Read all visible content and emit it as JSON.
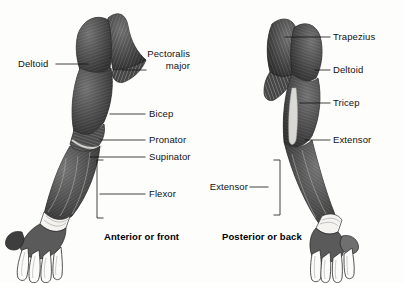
{
  "figure": {
    "title_anterior": "Anterior or front",
    "title_posterior": "Posterior or back",
    "background_color": "#fdfdfc",
    "ink_color": "#111111",
    "muscle_tone_dark": "#3a3a3a",
    "muscle_tone_mid": "#6b6b6b",
    "muscle_tone_light": "#a8a8a8",
    "tendon_color": "#f2f1ee"
  },
  "anterior": {
    "view_label": "Anterior or front",
    "labels": [
      {
        "id": "deltoid",
        "text": "Deltoid",
        "align": "left"
      },
      {
        "id": "pectoralis",
        "text": "Pectoralis",
        "align": "right"
      },
      {
        "id": "pectoralis_sub",
        "text": "major",
        "align": "right"
      },
      {
        "id": "bicep",
        "text": "Bicep",
        "align": "left"
      },
      {
        "id": "pronator",
        "text": "Pronator",
        "align": "left"
      },
      {
        "id": "supinator",
        "text": "Supinator",
        "align": "left"
      },
      {
        "id": "flexor",
        "text": "Flexor",
        "align": "left"
      }
    ]
  },
  "posterior": {
    "view_label": "Posterior or back",
    "labels": [
      {
        "id": "trapezius",
        "text": "Trapezius",
        "align": "left"
      },
      {
        "id": "deltoid",
        "text": "Deltoid",
        "align": "left"
      },
      {
        "id": "tricep",
        "text": "Tricep",
        "align": "left"
      },
      {
        "id": "extensor_right",
        "text": "Extensor",
        "align": "left"
      },
      {
        "id": "extensor_left",
        "text": "Extensor",
        "align": "right"
      }
    ]
  }
}
